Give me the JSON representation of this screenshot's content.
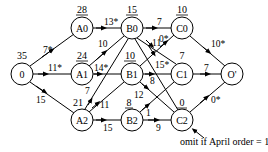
{
  "diagram": {
    "type": "directed-network",
    "nodes": [
      {
        "id": "0",
        "label": "0",
        "value": "35",
        "x": 22,
        "y": 74
      },
      {
        "id": "A0",
        "label": "A0",
        "value": "28",
        "x": 82,
        "y": 28
      },
      {
        "id": "A1",
        "label": "A1",
        "value": "24",
        "x": 82,
        "y": 74
      },
      {
        "id": "A2",
        "label": "A2",
        "value": "21",
        "x": 82,
        "y": 120
      },
      {
        "id": "B0",
        "label": "B0",
        "value": "15",
        "x": 132,
        "y": 28
      },
      {
        "id": "B1",
        "label": "B1",
        "value": "10",
        "x": 132,
        "y": 74
      },
      {
        "id": "B2",
        "label": "B2",
        "value": "8",
        "x": 132,
        "y": 120
      },
      {
        "id": "C0",
        "label": "C0",
        "value": "10",
        "x": 182,
        "y": 28
      },
      {
        "id": "C1",
        "label": "C1",
        "value": "7",
        "x": 182,
        "y": 74
      },
      {
        "id": "C2",
        "label": "C2",
        "value": "0",
        "x": 182,
        "y": 120
      },
      {
        "id": "O",
        "label": "O'",
        "value": "",
        "x": 232,
        "y": 74
      }
    ],
    "edges": [
      {
        "from": "0",
        "to": "A0",
        "label": "7*"
      },
      {
        "from": "0",
        "to": "A1",
        "label": "11*"
      },
      {
        "from": "0",
        "to": "A2",
        "label": "15"
      },
      {
        "from": "A0",
        "to": "B0",
        "label": "13*"
      },
      {
        "from": "A1",
        "to": "B0",
        "label": "10"
      },
      {
        "from": "A1",
        "to": "B1",
        "label": "14*"
      },
      {
        "from": "A2",
        "to": "B0",
        "label": "7"
      },
      {
        "from": "A2",
        "to": "B1",
        "label": "11"
      },
      {
        "from": "A2",
        "to": "B2",
        "label": "15"
      },
      {
        "from": "B0",
        "to": "C0",
        "label": "7"
      },
      {
        "from": "B0",
        "to": "C1",
        "label": "15*"
      },
      {
        "from": "B0",
        "to": "C2",
        "label": "11"
      },
      {
        "from": "B1",
        "to": "C0",
        "label": "0*"
      },
      {
        "from": "B1",
        "to": "C1",
        "label": "8"
      },
      {
        "from": "B1",
        "to": "C2",
        "label": "12"
      },
      {
        "from": "B2",
        "to": "C1",
        "label": "1"
      },
      {
        "from": "B2",
        "to": "C2",
        "label": "9"
      },
      {
        "from": "C0",
        "to": "O",
        "label": "10*"
      },
      {
        "from": "C1",
        "to": "O",
        "label": "7"
      },
      {
        "from": "C2",
        "to": "O",
        "label": "0*"
      }
    ],
    "annotation": {
      "text": "omit if April order = 1",
      "points_to": "C2"
    }
  }
}
